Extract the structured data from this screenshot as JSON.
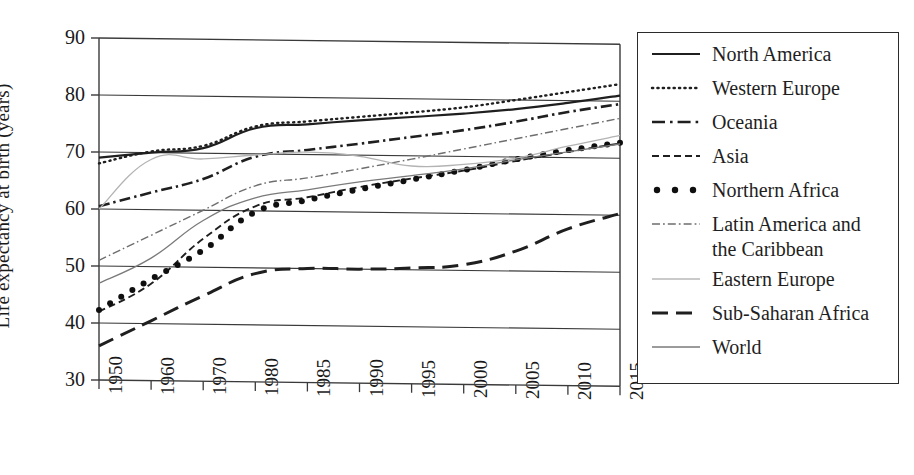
{
  "chart_data": {
    "type": "line",
    "title": "",
    "xlabel": "",
    "ylabel": "Life expectancy at birth (years)",
    "categories": [
      "1950",
      "1960",
      "1970",
      "1980",
      "1985",
      "1990",
      "1995",
      "2000",
      "2005",
      "2010",
      "2015"
    ],
    "ylim": [
      30,
      90
    ],
    "yticks": [
      30,
      40,
      50,
      60,
      70,
      80,
      90
    ],
    "grid": true,
    "legend_position": "right",
    "series": [
      {
        "name": "North America",
        "style": "solid",
        "color": "#1f1f1f",
        "values": [
          69.0,
          70.0,
          70.9,
          74.5,
          75.3,
          76.1,
          76.8,
          77.5,
          78.4,
          79.6,
          81.0
        ]
      },
      {
        "name": "Western Europe",
        "style": "dotted",
        "color": "#1f1f1f",
        "values": [
          68.0,
          70.2,
          71.3,
          74.8,
          75.8,
          76.7,
          77.6,
          78.6,
          80.0,
          81.5,
          83.0
        ]
      },
      {
        "name": "Oceania",
        "style": "dash-dot",
        "color": "#1f1f1f",
        "values": [
          60.5,
          63.0,
          65.5,
          69.5,
          70.8,
          72.0,
          73.3,
          74.6,
          76.2,
          78.0,
          79.5
        ]
      },
      {
        "name": "Asia",
        "style": "dashed",
        "color": "#1f1f1f",
        "values": [
          42.0,
          47.0,
          55.0,
          60.8,
          62.5,
          64.4,
          66.0,
          67.5,
          69.3,
          71.0,
          72.6
        ]
      },
      {
        "name": "Northern Africa",
        "style": "dots",
        "color": "#0f0f0f",
        "values": [
          42.3,
          47.8,
          53.0,
          59.8,
          62.0,
          64.0,
          65.8,
          67.6,
          69.6,
          71.3,
          72.7
        ]
      },
      {
        "name": "Latin America and the Caribbean",
        "style": "fine-dash-dot",
        "color": "#6e6e6e",
        "values": [
          51.0,
          55.5,
          60.0,
          64.4,
          65.9,
          67.6,
          69.4,
          71.3,
          73.2,
          75.1,
          77.0
        ]
      },
      {
        "name": "Eastern Europe",
        "style": "thin-solid-light",
        "color": "#b3b3b3",
        "values": [
          60.0,
          68.8,
          69.0,
          69.8,
          70.4,
          69.8,
          68.2,
          68.6,
          69.8,
          72.0,
          74.0
        ]
      },
      {
        "name": "Sub-Saharan Africa",
        "style": "long-dash",
        "color": "#1f1f1f",
        "values": [
          36.0,
          40.5,
          45.0,
          49.0,
          50.0,
          50.0,
          50.3,
          51.0,
          53.5,
          57.5,
          60.3
        ]
      },
      {
        "name": "World",
        "style": "thin-solid",
        "color": "#7a7a7a",
        "values": [
          47.0,
          51.5,
          58.2,
          62.3,
          63.8,
          65.3,
          66.5,
          67.8,
          69.5,
          71.0,
          72.5
        ]
      }
    ]
  },
  "axis": {
    "y_label": "Life expectancy at birth (years)",
    "y_ticks": [
      "90",
      "80",
      "70",
      "60",
      "50",
      "40",
      "30"
    ],
    "x_ticks": [
      "1950",
      "1960",
      "1970",
      "1980",
      "1985",
      "1990",
      "1995",
      "2000",
      "2005",
      "2010",
      "2015"
    ]
  },
  "legend": {
    "items": [
      {
        "label": "North America",
        "sample": "solid-line-sample"
      },
      {
        "label": "Western Europe",
        "sample": "dotted-line-sample"
      },
      {
        "label": "Oceania",
        "sample": "dash-dot-line-sample"
      },
      {
        "label": "Asia",
        "sample": "dashed-line-sample"
      },
      {
        "label": "Northern Africa",
        "sample": "dot-marker-sample"
      },
      {
        "label": "Latin America and the Caribbean",
        "sample": "fine-dash-dot-line-sample"
      },
      {
        "label": "Eastern Europe",
        "sample": "thin-light-line-sample"
      },
      {
        "label": "Sub-Saharan Africa",
        "sample": "long-dash-line-sample"
      },
      {
        "label": "World",
        "sample": "thin-line-sample"
      }
    ]
  }
}
